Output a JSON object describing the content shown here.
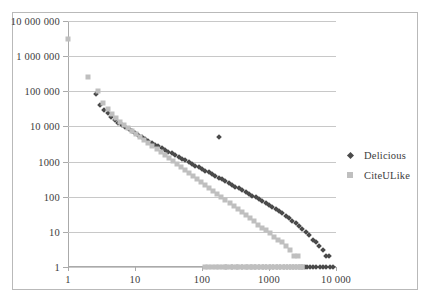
{
  "chart_data": {
    "type": "scatter",
    "title": "",
    "xlabel": "",
    "ylabel": "",
    "xscale": "log",
    "yscale": "log",
    "xlim": [
      1,
      10000
    ],
    "ylim": [
      1,
      10000000
    ],
    "grid": "horizontal",
    "legend_position": "right",
    "xticks": [
      "1",
      "10",
      "100",
      "1000",
      "10 000"
    ],
    "xtick_values": [
      1,
      10,
      100,
      1000,
      10000
    ],
    "yticks": [
      "10 000 000",
      "1 000 000",
      "100 000",
      "10 000",
      "1000",
      "100",
      "10",
      "1"
    ],
    "ytick_values": [
      10000000,
      1000000,
      100000,
      10000,
      1000,
      100,
      10,
      1
    ],
    "series": [
      {
        "name": "Delicious",
        "marker": "diamond",
        "color": "#4a4a4a",
        "points": [
          [
            2.6,
            85000
          ],
          [
            3.0,
            42000
          ],
          [
            3.4,
            30000
          ],
          [
            3.9,
            24000
          ],
          [
            4.4,
            19000
          ],
          [
            5.0,
            15000
          ],
          [
            5.6,
            12500
          ],
          [
            6.3,
            11000
          ],
          [
            7.1,
            9800
          ],
          [
            8.0,
            8500
          ],
          [
            9.0,
            7200
          ],
          [
            10.0,
            6300
          ],
          [
            11.2,
            5600
          ],
          [
            12.6,
            5000
          ],
          [
            14.1,
            4400
          ],
          [
            15.8,
            3900
          ],
          [
            17.8,
            3400
          ],
          [
            20.0,
            3000
          ],
          [
            22.4,
            2700
          ],
          [
            25.1,
            2400
          ],
          [
            28.2,
            2150
          ],
          [
            31.6,
            1900
          ],
          [
            35.5,
            1700
          ],
          [
            39.8,
            1500
          ],
          [
            44.7,
            1350
          ],
          [
            50.1,
            1200
          ],
          [
            56.2,
            1080
          ],
          [
            63.1,
            960
          ],
          [
            70.8,
            860
          ],
          [
            79.4,
            770
          ],
          [
            89.1,
            690
          ],
          [
            100.0,
            610
          ],
          [
            112.0,
            545
          ],
          [
            126.0,
            490
          ],
          [
            141.0,
            435
          ],
          [
            158.0,
            390
          ],
          [
            178.0,
            345
          ],
          [
            200.0,
            310
          ],
          [
            224.0,
            275
          ],
          [
            251.0,
            245
          ],
          [
            282.0,
            218
          ],
          [
            316.0,
            195
          ],
          [
            355.0,
            172
          ],
          [
            398.0,
            153
          ],
          [
            447.0,
            136
          ],
          [
            501.0,
            120
          ],
          [
            562.0,
            107
          ],
          [
            631.0,
            95
          ],
          [
            708.0,
            84
          ],
          [
            794.0,
            74
          ],
          [
            891.0,
            66
          ],
          [
            1000.0,
            58
          ],
          [
            1122.0,
            51
          ],
          [
            1259.0,
            45
          ],
          [
            1413.0,
            39
          ],
          [
            1585.0,
            34
          ],
          [
            1778.0,
            29
          ],
          [
            1995.0,
            25
          ],
          [
            2239.0,
            21
          ],
          [
            2512.0,
            18
          ],
          [
            2818.0,
            15
          ],
          [
            3162.0,
            12
          ],
          [
            3548.0,
            10
          ],
          [
            3981.0,
            8
          ],
          [
            4467.0,
            6
          ],
          [
            5012.0,
            5
          ],
          [
            5623.0,
            4
          ],
          [
            6310.0,
            3
          ],
          [
            7079.0,
            2
          ],
          [
            7943.0,
            2
          ],
          [
            8913.0,
            1
          ],
          [
            180.0,
            5000
          ],
          [
            230.0,
            1
          ],
          [
            280.0,
            1
          ],
          [
            330.0,
            1
          ],
          [
            400.0,
            1
          ],
          [
            470.0,
            1
          ],
          [
            540.0,
            1
          ],
          [
            620.0,
            1
          ],
          [
            700.0,
            1
          ],
          [
            800.0,
            1
          ],
          [
            900.0,
            1
          ],
          [
            1020.0,
            1
          ],
          [
            1150.0,
            1
          ],
          [
            1300.0,
            1
          ],
          [
            1450.0,
            1
          ],
          [
            1650.0,
            1
          ],
          [
            1850.0,
            1
          ],
          [
            2050.0,
            1
          ],
          [
            2300.0,
            1
          ],
          [
            2550.0,
            1
          ],
          [
            2800.0,
            1
          ],
          [
            3100.0,
            1
          ],
          [
            3400.0,
            1
          ],
          [
            3750.0,
            1
          ],
          [
            4100.0,
            1
          ],
          [
            4600.0,
            1
          ],
          [
            5100.0,
            1
          ],
          [
            5700.0,
            1
          ],
          [
            6400.0,
            1
          ],
          [
            7200.0,
            1
          ],
          [
            8100.0,
            1
          ]
        ]
      },
      {
        "name": "CiteULike",
        "marker": "square",
        "color": "#bfbfbf",
        "points": [
          [
            1.0,
            3000000
          ],
          [
            2.0,
            260000
          ],
          [
            2.8,
            105000
          ],
          [
            3.3,
            46000
          ],
          [
            3.9,
            31000
          ],
          [
            4.5,
            22000
          ],
          [
            5.2,
            17000
          ],
          [
            6.0,
            13500
          ],
          [
            6.9,
            11000
          ],
          [
            7.9,
            9000
          ],
          [
            9.1,
            7400
          ],
          [
            10.5,
            6000
          ],
          [
            12.0,
            5000
          ],
          [
            13.8,
            4100
          ],
          [
            15.9,
            3400
          ],
          [
            18.2,
            2800
          ],
          [
            21.0,
            2300
          ],
          [
            24.1,
            1900
          ],
          [
            27.7,
            1550
          ],
          [
            31.9,
            1280
          ],
          [
            36.6,
            1050
          ],
          [
            42.1,
            870
          ],
          [
            48.4,
            715
          ],
          [
            55.6,
            590
          ],
          [
            63.9,
            485
          ],
          [
            73.5,
            400
          ],
          [
            84.5,
            328
          ],
          [
            97.1,
            270
          ],
          [
            111.6,
            222
          ],
          [
            128.3,
            182
          ],
          [
            147.5,
            150
          ],
          [
            169.5,
            123
          ],
          [
            194.9,
            101
          ],
          [
            224.0,
            83
          ],
          [
            257.5,
            68
          ],
          [
            296.0,
            56
          ],
          [
            340.3,
            46
          ],
          [
            391.2,
            37
          ],
          [
            449.6,
            30
          ],
          [
            516.8,
            25
          ],
          [
            594.0,
            20
          ],
          [
            682.8,
            16
          ],
          [
            784.8,
            13
          ],
          [
            902.2,
            11
          ],
          [
            1037.0,
            9
          ],
          [
            1192.0,
            7
          ],
          [
            1370.0,
            6
          ],
          [
            1575.0,
            5
          ],
          [
            1810.0,
            4
          ],
          [
            2080.0,
            3
          ],
          [
            2392.0,
            2
          ],
          [
            2750.0,
            2
          ],
          [
            3160.0,
            1
          ],
          [
            110.0,
            1
          ],
          [
            125.0,
            1
          ],
          [
            140.0,
            1
          ],
          [
            160.0,
            1
          ],
          [
            180.0,
            1
          ],
          [
            205.0,
            1
          ],
          [
            230.0,
            1
          ],
          [
            260.0,
            1
          ],
          [
            290.0,
            1
          ],
          [
            330.0,
            1
          ],
          [
            370.0,
            1
          ],
          [
            420.0,
            1
          ],
          [
            470.0,
            1
          ],
          [
            530.0,
            1
          ],
          [
            600.0,
            1
          ],
          [
            670.0,
            1
          ],
          [
            760.0,
            1
          ],
          [
            850.0,
            1
          ],
          [
            960.0,
            1
          ],
          [
            1080.0,
            1
          ],
          [
            1220.0,
            1
          ],
          [
            1370.0,
            1
          ],
          [
            1550.0,
            1
          ],
          [
            1740.0,
            1
          ],
          [
            1960.0,
            1
          ],
          [
            2200.0,
            1
          ],
          [
            2480.0,
            1
          ],
          [
            2790.0,
            1
          ],
          [
            3140.0,
            1
          ]
        ]
      }
    ]
  },
  "legend": {
    "items": [
      {
        "label": "Delicious",
        "marker": "diamond"
      },
      {
        "label": "CiteULike",
        "marker": "square"
      }
    ]
  }
}
